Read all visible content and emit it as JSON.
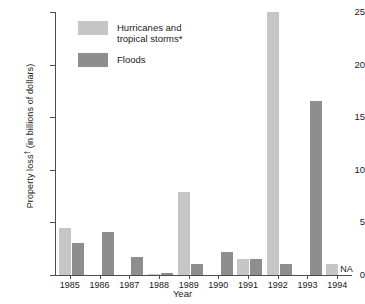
{
  "chart_data": {
    "type": "bar",
    "title": "",
    "xlabel": "Year",
    "ylabel": "Property loss† (in billions of dollars)",
    "ylabel_main": "Property loss",
    "ylabel_dagger": "†",
    "ylabel_tail": " (in billions of dollars)",
    "categories": [
      "1985",
      "1986",
      "1987",
      "1988",
      "1989",
      "1990",
      "1991",
      "1992",
      "1993",
      "1994"
    ],
    "ylim": [
      0,
      25
    ],
    "yticks": [
      0,
      5,
      10,
      15,
      20,
      25
    ],
    "ytick_labels": [
      "0",
      "5",
      "10",
      "15",
      "20",
      "25"
    ],
    "grid": false,
    "legend_position": "upper-left-inside",
    "series": [
      {
        "name": "Hurricanes and tropical storms*",
        "legend_label": "Hurricanes and\ntropical storms*",
        "color": "#c6c6c6",
        "values": [
          4.5,
          0,
          0,
          0.1,
          7.9,
          0,
          1.5,
          25.0,
          0,
          1.0
        ]
      },
      {
        "name": "Floods",
        "legend_label": "Floods",
        "color": "#8e8e8e",
        "values": [
          3.0,
          4.1,
          1.7,
          0.15,
          1.0,
          2.2,
          1.5,
          1.0,
          16.5,
          null
        ]
      }
    ],
    "annotations": [
      {
        "text": "NA",
        "category": "1994",
        "series": "Floods"
      }
    ]
  },
  "colors": {
    "hurricanes": "#c6c6c6",
    "floods": "#8e8e8e",
    "axis": "#4d4d4d",
    "text": "#1a1a1a",
    "background": "#ffffff"
  }
}
